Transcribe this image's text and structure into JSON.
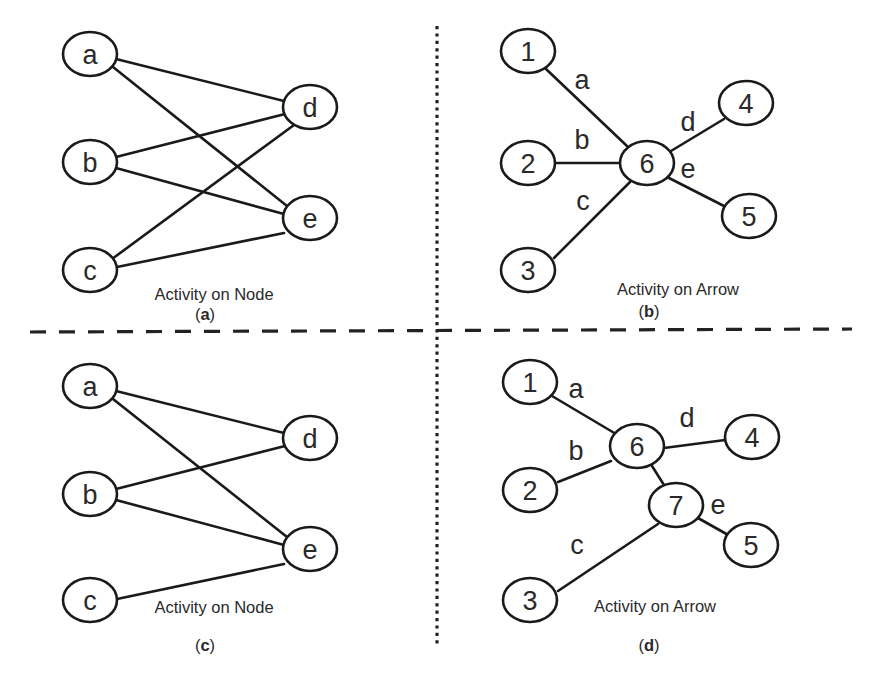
{
  "figure": {
    "dividers": {
      "vertical": {
        "x": 437,
        "y1": 26,
        "y2": 644,
        "style": "dotted"
      },
      "horizontal": {
        "x1": 30,
        "y1": 332,
        "x2": 852,
        "y2": 329,
        "style": "dashed"
      }
    },
    "node_size": {
      "rx": 27,
      "ry": 22
    },
    "panels": [
      {
        "id": "a",
        "caption": "Activity on Node",
        "caption_pos": {
          "x": 214,
          "y": 300
        },
        "tag_open": "(",
        "tag_letter": "a",
        "tag_close": ")",
        "tag_pos": {
          "x": 205,
          "y": 320
        },
        "nodes": [
          {
            "id": "a",
            "label": "a",
            "x": 90,
            "y": 54
          },
          {
            "id": "b",
            "label": "b",
            "x": 90,
            "y": 162
          },
          {
            "id": "c",
            "label": "c",
            "x": 90,
            "y": 270
          },
          {
            "id": "d",
            "label": "d",
            "x": 310,
            "y": 107
          },
          {
            "id": "e",
            "label": "e",
            "x": 310,
            "y": 218
          }
        ],
        "edges": [
          {
            "from": "a",
            "to": "d",
            "x1": 116,
            "y1": 59,
            "x2": 284,
            "y2": 101
          },
          {
            "from": "a",
            "to": "e",
            "x1": 113,
            "y1": 67,
            "x2": 287,
            "y2": 206
          },
          {
            "from": "b",
            "to": "d",
            "x1": 116,
            "y1": 157,
            "x2": 285,
            "y2": 114
          },
          {
            "from": "b",
            "to": "e",
            "x1": 116,
            "y1": 168,
            "x2": 284,
            "y2": 214
          },
          {
            "from": "c",
            "to": "d",
            "x1": 112,
            "y1": 259,
            "x2": 294,
            "y2": 125
          },
          {
            "from": "c",
            "to": "e",
            "x1": 117,
            "y1": 267,
            "x2": 284,
            "y2": 233
          }
        ]
      },
      {
        "id": "b",
        "caption": "Activity on Arrow",
        "caption_pos": {
          "x": 678,
          "y": 295
        },
        "tag_open": "(",
        "tag_letter": "b",
        "tag_close": ")",
        "tag_pos": {
          "x": 649,
          "y": 317
        },
        "nodes": [
          {
            "id": "1",
            "label": "1",
            "x": 528,
            "y": 51
          },
          {
            "id": "2",
            "label": "2",
            "x": 528,
            "y": 163
          },
          {
            "id": "3",
            "label": "3",
            "x": 528,
            "y": 270
          },
          {
            "id": "6",
            "label": "6",
            "x": 647,
            "y": 163
          },
          {
            "id": "4",
            "label": "4",
            "x": 746,
            "y": 103
          },
          {
            "id": "5",
            "label": "5",
            "x": 749,
            "y": 216
          }
        ],
        "edges": [
          {
            "from": "1",
            "to": "6",
            "label": "a",
            "x1": 546,
            "y1": 69,
            "x2": 627,
            "y2": 146,
            "lx": 582,
            "ly": 80
          },
          {
            "from": "2",
            "to": "6",
            "label": "b",
            "x1": 555,
            "y1": 163,
            "x2": 620,
            "y2": 163,
            "lx": 582,
            "ly": 140
          },
          {
            "from": "3",
            "to": "6",
            "label": "c",
            "x1": 554,
            "y1": 258,
            "x2": 630,
            "y2": 182,
            "lx": 583,
            "ly": 201
          },
          {
            "from": "6",
            "to": "4",
            "label": "d",
            "x1": 671,
            "y1": 151,
            "x2": 724,
            "y2": 119,
            "lx": 688,
            "ly": 122
          },
          {
            "from": "6",
            "to": "5",
            "label": "e",
            "x1": 667,
            "y1": 177,
            "x2": 724,
            "y2": 206,
            "lx": 688,
            "ly": 169
          }
        ]
      },
      {
        "id": "c",
        "caption": "Activity on Node",
        "caption_pos": {
          "x": 214,
          "y": 613
        },
        "tag_open": "(",
        "tag_letter": "c",
        "tag_close": ")",
        "tag_pos": {
          "x": 205,
          "y": 651
        },
        "nodes": [
          {
            "id": "a",
            "label": "a",
            "x": 90,
            "y": 386
          },
          {
            "id": "b",
            "label": "b",
            "x": 90,
            "y": 494
          },
          {
            "id": "c",
            "label": "c",
            "x": 90,
            "y": 600
          },
          {
            "id": "d",
            "label": "d",
            "x": 310,
            "y": 438
          },
          {
            "id": "e",
            "label": "e",
            "x": 310,
            "y": 549
          }
        ],
        "edges": [
          {
            "from": "a",
            "to": "d",
            "x1": 116,
            "y1": 391,
            "x2": 284,
            "y2": 433
          },
          {
            "from": "a",
            "to": "e",
            "x1": 113,
            "y1": 399,
            "x2": 287,
            "y2": 537
          },
          {
            "from": "b",
            "to": "d",
            "x1": 116,
            "y1": 489,
            "x2": 285,
            "y2": 446
          },
          {
            "from": "b",
            "to": "e",
            "x1": 116,
            "y1": 500,
            "x2": 284,
            "y2": 545
          },
          {
            "from": "c",
            "to": "e",
            "x1": 117,
            "y1": 599,
            "x2": 284,
            "y2": 564
          }
        ]
      },
      {
        "id": "d",
        "caption": "Activity on Arrow",
        "caption_pos": {
          "x": 655,
          "y": 612
        },
        "tag_open": "(",
        "tag_letter": "d",
        "tag_close": ")",
        "tag_pos": {
          "x": 649,
          "y": 651
        },
        "nodes": [
          {
            "id": "1",
            "label": "1",
            "x": 530,
            "y": 382
          },
          {
            "id": "2",
            "label": "2",
            "x": 530,
            "y": 490
          },
          {
            "id": "3",
            "label": "3",
            "x": 530,
            "y": 600
          },
          {
            "id": "6",
            "label": "6",
            "x": 637,
            "y": 446
          },
          {
            "id": "7",
            "label": "7",
            "x": 676,
            "y": 505
          },
          {
            "id": "4",
            "label": "4",
            "x": 752,
            "y": 437
          },
          {
            "id": "5",
            "label": "5",
            "x": 751,
            "y": 545
          }
        ],
        "edges": [
          {
            "from": "1",
            "to": "6",
            "label": "a",
            "x1": 552,
            "y1": 396,
            "x2": 616,
            "y2": 434,
            "lx": 576,
            "ly": 389
          },
          {
            "from": "2",
            "to": "6",
            "label": "b",
            "x1": 558,
            "y1": 482,
            "x2": 611,
            "y2": 461,
            "lx": 576,
            "ly": 451
          },
          {
            "from": "6",
            "to": "4",
            "label": "d",
            "x1": 664,
            "y1": 448,
            "x2": 725,
            "y2": 440,
            "lx": 687,
            "ly": 418
          },
          {
            "from": "6",
            "to": "7",
            "label": "",
            "x1": 652,
            "y1": 466,
            "x2": 664,
            "y2": 485,
            "lx": 0,
            "ly": 0
          },
          {
            "from": "3",
            "to": "7",
            "label": "c",
            "x1": 558,
            "y1": 591,
            "x2": 658,
            "y2": 524,
            "lx": 577,
            "ly": 545
          },
          {
            "from": "7",
            "to": "5",
            "label": "e",
            "x1": 698,
            "y1": 518,
            "x2": 730,
            "y2": 536,
            "lx": 718,
            "ly": 505
          }
        ]
      }
    ]
  }
}
